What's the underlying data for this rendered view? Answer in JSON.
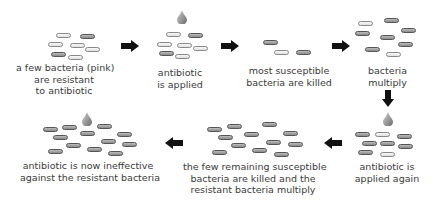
{
  "diagram": {
    "stages": [
      {
        "id": "s1",
        "label_lines": [
          "a few bacteria (pink)",
          "are resistant",
          "to antibiotic"
        ]
      },
      {
        "id": "s2",
        "label_lines": [
          "antibiotic",
          "is applied"
        ]
      },
      {
        "id": "s3",
        "label_lines": [
          "most susceptible",
          "bacteria are killed"
        ]
      },
      {
        "id": "s4",
        "label_lines": [
          "bacteria",
          "multiply"
        ]
      },
      {
        "id": "s5",
        "label_lines": [
          "antibiotic is",
          "applied again"
        ]
      },
      {
        "id": "s6",
        "label_lines": [
          "the few remaining susceptible",
          "bacteria are killed and the",
          "resistant bacteria multiply"
        ]
      },
      {
        "id": "s7",
        "label_lines": [
          "antibiotic is now ineffective",
          "against the resistant bacteria"
        ]
      }
    ],
    "arrows": [
      {
        "from": "s1",
        "to": "s2",
        "direction": "right"
      },
      {
        "from": "s2",
        "to": "s3",
        "direction": "right"
      },
      {
        "from": "s3",
        "to": "s4",
        "direction": "right"
      },
      {
        "from": "s4",
        "to": "s5",
        "direction": "down"
      },
      {
        "from": "s5",
        "to": "s6",
        "direction": "left"
      },
      {
        "from": "s6",
        "to": "s7",
        "direction": "left"
      }
    ],
    "colors": {
      "susceptible": "#bdbdbd",
      "resistant": "#e8e8e8",
      "arrow": "#111111",
      "drop": "#8a8a8a"
    }
  }
}
